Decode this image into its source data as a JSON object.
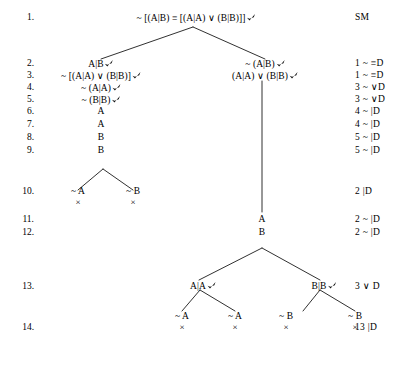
{
  "document": {
    "kind": "truth-tree-proof",
    "header_label": "SM",
    "page_width": 402,
    "page_height": 376,
    "ink_color": "#000000",
    "background_color": "#ffffff"
  },
  "line_numbers": [
    "1.",
    "2.",
    "3.",
    "4.",
    "5.",
    "6.",
    "7.",
    "8.",
    "9.",
    "10.",
    "11.",
    "12.",
    "13.",
    "14."
  ],
  "justifications": [
    {
      "line": "1",
      "text": "SM"
    },
    {
      "line": "2",
      "text": "1 ~ ≡D"
    },
    {
      "line": "3",
      "text": "1 ~ ≡D"
    },
    {
      "line": "4",
      "text": "3 ~ ∨D"
    },
    {
      "line": "5",
      "text": "3 ~ ∨D"
    },
    {
      "line": "6",
      "text": "4 ~ |D"
    },
    {
      "line": "7",
      "text": "4 ~ |D"
    },
    {
      "line": "8",
      "text": "5 ~ |D"
    },
    {
      "line": "9",
      "text": "5 ~ |D"
    },
    {
      "line": "10",
      "text": "2 |D"
    },
    {
      "line": "11",
      "text": "2 ~ |D"
    },
    {
      "line": "12",
      "text": "2 ~ |D"
    },
    {
      "line": "13",
      "text": "3 ∨ D"
    },
    {
      "line": "14",
      "text": "13 |D"
    }
  ],
  "formulas": [
    {
      "id": "f1",
      "line": "1",
      "text": "~ [(A|B) ≡ [(A|A) ∨ (B|B)]]",
      "checked": true
    },
    {
      "id": "f2L",
      "line": "2",
      "text": "A|B",
      "checked": true
    },
    {
      "id": "f2R",
      "line": "2",
      "text": "~ (A|B)",
      "checked": true
    },
    {
      "id": "f3L",
      "line": "3",
      "text": "~ [(A|A) ∨ (B|B)]",
      "checked": true
    },
    {
      "id": "f3R",
      "line": "3",
      "text": "(A|A) ∨ (B|B)",
      "checked": true
    },
    {
      "id": "f4",
      "line": "4",
      "text": "~ (A|A)",
      "checked": true
    },
    {
      "id": "f5",
      "line": "5",
      "text": "~ (B|B)",
      "checked": true
    },
    {
      "id": "f6",
      "line": "6",
      "text": "A",
      "checked": false
    },
    {
      "id": "f7",
      "line": "7",
      "text": "A",
      "checked": false
    },
    {
      "id": "f8",
      "line": "8",
      "text": "B",
      "checked": false
    },
    {
      "id": "f9",
      "line": "9",
      "text": "B",
      "checked": false
    },
    {
      "id": "f10L",
      "line": "10",
      "text": "~ A",
      "checked": false,
      "closed": true
    },
    {
      "id": "f10R",
      "line": "10",
      "text": "~ B",
      "checked": false,
      "closed": true
    },
    {
      "id": "f11",
      "line": "11",
      "text": "A",
      "checked": false
    },
    {
      "id": "f12",
      "line": "12",
      "text": "B",
      "checked": false
    },
    {
      "id": "f13L",
      "line": "13",
      "text": "A|A",
      "checked": true
    },
    {
      "id": "f13R",
      "line": "13",
      "text": "B|B",
      "checked": true
    },
    {
      "id": "f14a",
      "line": "14",
      "text": "~ A",
      "checked": false,
      "closed": true
    },
    {
      "id": "f14b",
      "line": "14",
      "text": "~ A",
      "checked": false,
      "closed": true
    },
    {
      "id": "f14c",
      "line": "14",
      "text": "~ B",
      "checked": false,
      "closed": true
    },
    {
      "id": "f14d",
      "line": "14",
      "text": "~ B",
      "checked": false,
      "closed": true
    }
  ],
  "closure_marks": [
    {
      "for": "f10L",
      "symbol": "×"
    },
    {
      "for": "f10R",
      "symbol": "×"
    },
    {
      "for": "f14a",
      "symbol": "×"
    },
    {
      "for": "f14b",
      "symbol": "×"
    },
    {
      "for": "f14c",
      "symbol": "×"
    },
    {
      "for": "f14d",
      "symbol": "×"
    }
  ],
  "symbols": {
    "negation": "~",
    "equivalence": "≡",
    "disjunction": "∨",
    "sheffer_stroke": "|",
    "check": "✔",
    "closure": "×"
  }
}
